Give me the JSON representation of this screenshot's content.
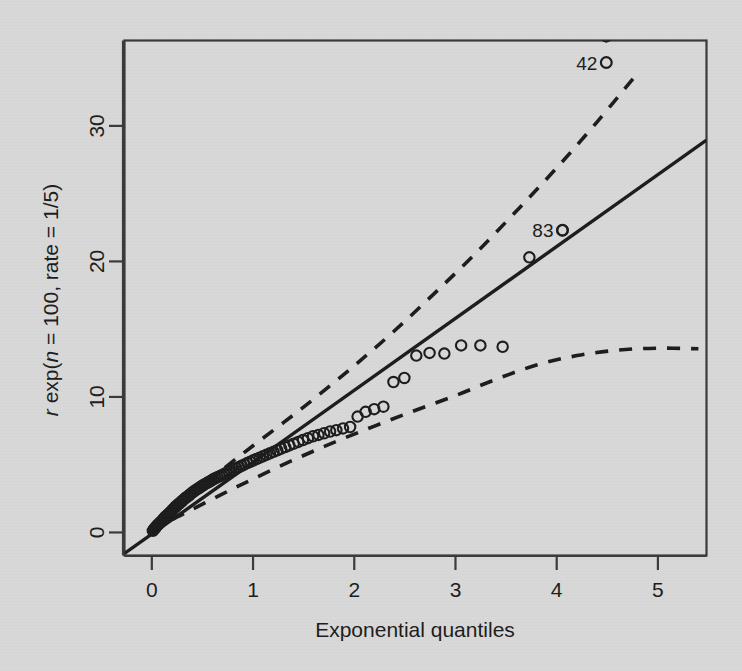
{
  "figure": {
    "background_color": "#d8d8d8",
    "ink_color": "#1c1c1c",
    "panel_border_color": "#3a3a3a"
  },
  "chart_data": {
    "type": "scatter",
    "title": "",
    "subtitle": "",
    "xlabel": "Exponential quantiles",
    "ylabel": "r exp(n = 100, rate = 1/5)",
    "ylabel_parts": {
      "var": "r",
      "fn_open": " exp(",
      "n_var": "n",
      "rest": " = 100, rate = 1/5)"
    },
    "grid": false,
    "legend": false,
    "xlim": [
      -0.27,
      5.48
    ],
    "ylim": [
      -1.7,
      36.3
    ],
    "xticks": [
      0,
      1,
      2,
      3,
      4,
      5
    ],
    "xticklabels": [
      "0",
      "1",
      "2",
      "3",
      "4",
      "5"
    ],
    "yticks": [
      0,
      10,
      20,
      30
    ],
    "yticklabels": [
      "0",
      "10",
      "20",
      "30"
    ],
    "reference_line": {
      "style": "solid",
      "description": "QQ reference line through the quartiles",
      "x": [
        -0.27,
        5.48
      ],
      "y": [
        -1.55,
        28.95
      ]
    },
    "confidence_bands": [
      {
        "name": "upper-band",
        "style": "dashed",
        "x": [
          0.0,
          0.2,
          0.4,
          0.6,
          0.8,
          1.0,
          1.3,
          1.6,
          2.0,
          2.4,
          2.8,
          3.2,
          3.6,
          4.0,
          4.4,
          4.8
        ],
        "y": [
          0.2,
          1.55,
          2.85,
          4.05,
          5.25,
          6.4,
          8.1,
          9.85,
          12.3,
          14.9,
          17.7,
          20.6,
          23.7,
          26.9,
          30.3,
          33.9
        ]
      },
      {
        "name": "lower-band",
        "style": "dashed",
        "x": [
          0.0,
          0.2,
          0.4,
          0.7,
          1.0,
          1.4,
          1.8,
          2.2,
          2.6,
          3.0,
          3.4,
          3.8,
          4.2,
          4.6,
          5.0,
          5.4
        ],
        "y": [
          0.05,
          0.95,
          1.7,
          2.85,
          3.95,
          5.35,
          6.65,
          7.85,
          9.0,
          10.1,
          11.3,
          12.35,
          13.05,
          13.45,
          13.6,
          13.55
        ]
      }
    ],
    "series": [
      {
        "name": "sample quantiles",
        "marker": "open-circle",
        "n": 100,
        "points": [
          [
            0.01,
            0.12
          ],
          [
            0.02,
            0.22
          ],
          [
            0.03,
            0.31
          ],
          [
            0.041,
            0.4
          ],
          [
            0.051,
            0.5
          ],
          [
            0.062,
            0.58
          ],
          [
            0.073,
            0.66
          ],
          [
            0.084,
            0.74
          ],
          [
            0.095,
            0.82
          ],
          [
            0.107,
            0.92
          ],
          [
            0.118,
            1.02
          ],
          [
            0.13,
            1.12
          ],
          [
            0.142,
            1.2
          ],
          [
            0.154,
            1.28
          ],
          [
            0.166,
            1.36
          ],
          [
            0.178,
            1.45
          ],
          [
            0.191,
            1.55
          ],
          [
            0.204,
            1.66
          ],
          [
            0.217,
            1.76
          ],
          [
            0.23,
            1.86
          ],
          [
            0.243,
            1.95
          ],
          [
            0.257,
            2.05
          ],
          [
            0.271,
            2.14
          ],
          [
            0.285,
            2.22
          ],
          [
            0.299,
            2.32
          ],
          [
            0.314,
            2.42
          ],
          [
            0.328,
            2.52
          ],
          [
            0.343,
            2.6
          ],
          [
            0.359,
            2.68
          ],
          [
            0.374,
            2.78
          ],
          [
            0.39,
            2.88
          ],
          [
            0.406,
            2.98
          ],
          [
            0.423,
            3.07
          ],
          [
            0.44,
            3.16
          ],
          [
            0.457,
            3.24
          ],
          [
            0.474,
            3.32
          ],
          [
            0.492,
            3.41
          ],
          [
            0.51,
            3.5
          ],
          [
            0.529,
            3.58
          ],
          [
            0.548,
            3.66
          ],
          [
            0.567,
            3.74
          ],
          [
            0.587,
            3.83
          ],
          [
            0.607,
            3.92
          ],
          [
            0.627,
            4.0
          ],
          [
            0.648,
            4.08
          ],
          [
            0.67,
            4.15
          ],
          [
            0.692,
            4.23
          ],
          [
            0.714,
            4.32
          ],
          [
            0.737,
            4.4
          ],
          [
            0.761,
            4.48
          ],
          [
            0.785,
            4.56
          ],
          [
            0.81,
            4.65
          ],
          [
            0.835,
            4.74
          ],
          [
            0.861,
            4.83
          ],
          [
            0.888,
            4.92
          ],
          [
            0.916,
            5.02
          ],
          [
            0.944,
            5.12
          ],
          [
            0.973,
            5.22
          ],
          [
            1.003,
            5.32
          ],
          [
            1.034,
            5.42
          ],
          [
            1.066,
            5.52
          ],
          [
            1.098,
            5.62
          ],
          [
            1.132,
            5.73
          ],
          [
            1.167,
            5.84
          ],
          [
            1.203,
            5.95
          ],
          [
            1.24,
            6.06
          ],
          [
            1.278,
            6.18
          ],
          [
            1.318,
            6.3
          ],
          [
            1.359,
            6.42
          ],
          [
            1.402,
            6.55
          ],
          [
            1.447,
            6.68
          ],
          [
            1.493,
            6.82
          ],
          [
            1.542,
            6.96
          ],
          [
            1.593,
            7.1
          ],
          [
            1.646,
            7.2
          ],
          [
            1.702,
            7.32
          ],
          [
            1.761,
            7.45
          ],
          [
            1.823,
            7.55
          ],
          [
            1.889,
            7.68
          ],
          [
            1.959,
            7.78
          ],
          [
            2.033,
            8.55
          ],
          [
            2.112,
            8.9
          ],
          [
            2.197,
            9.1
          ],
          [
            2.288,
            9.28
          ],
          [
            2.387,
            11.1
          ],
          [
            2.495,
            11.4
          ],
          [
            2.613,
            13.05
          ],
          [
            2.744,
            13.25
          ],
          [
            2.89,
            13.2
          ],
          [
            3.056,
            13.8
          ],
          [
            3.246,
            13.8
          ],
          [
            3.466,
            13.7
          ],
          [
            3.73,
            20.3
          ],
          [
            4.057,
            22.3
          ],
          [
            4.49,
            36.6
          ],
          [
            4.6,
            37.2
          ]
        ]
      }
    ],
    "annotations": [
      {
        "label": "42",
        "point": [
          4.49,
          36.6
        ],
        "label_position": "left",
        "description": "outlier observation 42 near the top-right corner"
      },
      {
        "label": "83",
        "point": [
          4.057,
          22.3
        ],
        "label_position": "left",
        "description": "outlier observation 83 on the reference line"
      }
    ]
  }
}
